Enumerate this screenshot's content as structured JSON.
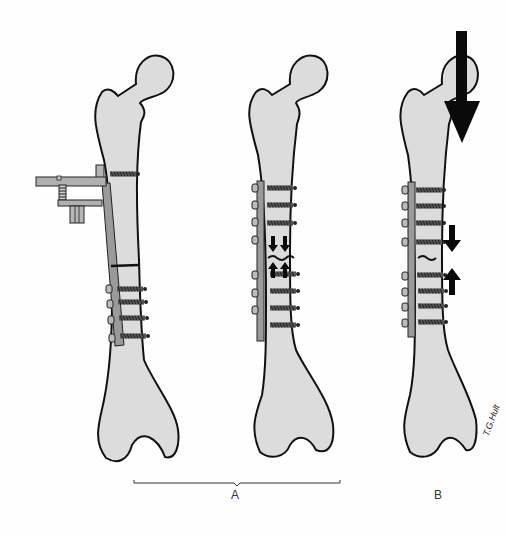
{
  "figure": {
    "labels": {
      "group_a": "A",
      "group_b": "B",
      "signature": "T.G.Hult"
    },
    "panels": [
      {
        "id": "femur-1",
        "group": "A",
        "description": "Femur with plate and external tensioning device (compression clamp)"
      },
      {
        "id": "femur-2",
        "group": "A",
        "description": "Femur with compression plate; arrows show interfragmentary compression at fracture"
      },
      {
        "id": "femur-3",
        "group": "B",
        "description": "Femur with plate under axial load; large arrow shows weight bearing, small arrows compression at fracture"
      }
    ],
    "colors": {
      "bone_fill": "#dcdcdc",
      "outline": "#111111",
      "plate": "#9a9a9a",
      "arrow": "#0a0a0a",
      "background": "#fefefe"
    }
  }
}
